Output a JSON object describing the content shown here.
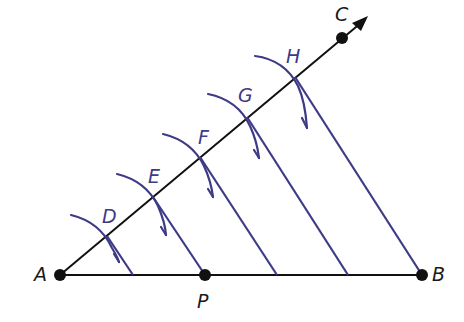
{
  "colors": {
    "line": "#111111",
    "construction": "#3d3a86",
    "background": "#ffffff"
  },
  "points": {
    "A": {
      "label": "A",
      "x": 60,
      "y": 275
    },
    "B": {
      "label": "B",
      "x": 422,
      "y": 275
    },
    "P": {
      "label": "P",
      "x": 205,
      "y": 275
    },
    "C": {
      "label": "C",
      "x": 342,
      "y": 38
    }
  },
  "ray_points": [
    {
      "label": "D",
      "x": 107,
      "y": 236
    },
    {
      "label": "E",
      "x": 153,
      "y": 197
    },
    {
      "label": "F",
      "x": 200,
      "y": 157
    },
    {
      "label": "G",
      "x": 247,
      "y": 117
    },
    {
      "label": "H",
      "x": 295,
      "y": 77
    }
  ],
  "segment_division_points_on_AB": [
    133,
    205,
    277,
    348,
    422
  ],
  "labels": {
    "A": "A",
    "B": "B",
    "P": "P",
    "C": "C",
    "D": "D",
    "E": "E",
    "F": "F",
    "G": "G",
    "H": "H"
  }
}
